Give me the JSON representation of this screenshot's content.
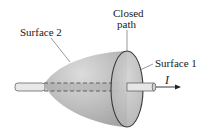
{
  "diagram": {
    "labels": {
      "surface2": "Surface 2",
      "closed_path_line1": "Closed",
      "closed_path_line2": "path",
      "surface1": "Surface 1",
      "current": "I"
    },
    "colors": {
      "surface_fill": "#b8b8b8",
      "surface_highlight": "#dcdcdc",
      "outline": "#3a3a3a",
      "wire_fill": "#e6e6e6"
    }
  }
}
